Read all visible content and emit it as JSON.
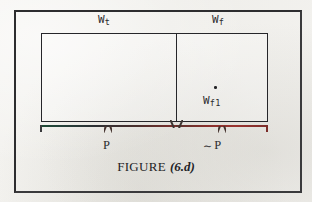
{
  "figure": {
    "caption_word": "FIGURE",
    "caption_number": "(6.d)",
    "background_color": "#f2f1ee",
    "ink_color": "#26262a"
  },
  "regions": {
    "left": {
      "name": "W_t",
      "label_base": "W",
      "label_sub": "t"
    },
    "right": {
      "name": "W_f",
      "label_base": "W",
      "label_sub": "f"
    }
  },
  "point": {
    "marker": "dot-point-marker",
    "label_base": "W",
    "label_sub": "f1",
    "name": "W_f1"
  },
  "braces": [
    {
      "id": "brace-p",
      "label": "P",
      "spans_region": "W_t",
      "color": "#2c2f33"
    },
    {
      "id": "brace-not-p",
      "label": "P",
      "prefix_symbol": "∼",
      "spans_region": "W_f",
      "color": "#8a2f2b"
    }
  ],
  "chart_data": {
    "type": "diagram",
    "boxes": [
      {
        "label": "W_t",
        "x_fraction": [
          0.0,
          0.595
        ],
        "contains": []
      },
      {
        "label": "W_f",
        "x_fraction": [
          0.595,
          1.0
        ],
        "contains": [
          "W_f1"
        ]
      }
    ],
    "points": [
      {
        "label": "W_f1",
        "inside": "W_f"
      }
    ],
    "brackets": [
      {
        "label": "P",
        "under": "W_t"
      },
      {
        "label": "~P",
        "under": "W_f"
      }
    ]
  }
}
